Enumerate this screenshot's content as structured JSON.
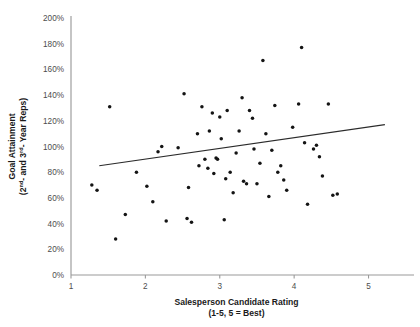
{
  "chart_data": {
    "type": "scatter",
    "title": "",
    "xlabel": "Salesperson Candidate Rating",
    "xlabel_sub": "(1-5, 5 = Best)",
    "ylabel_line1": "Goal Attainment",
    "ylabel_line2_pre": "(2",
    "ylabel_sup1": "nd",
    "ylabel_line2_mid": "- and 3",
    "ylabel_sup2": "rd",
    "ylabel_line2_post": "- Year Reps)",
    "ylabel": "Goal Attainment (2nd- and 3rd- Year Reps)",
    "xlim": [
      1,
      5.45
    ],
    "ylim": [
      0,
      200
    ],
    "xticks": [
      1,
      2,
      3,
      4,
      5
    ],
    "xtick_labels": [
      "1",
      "2",
      "3",
      "4",
      "5"
    ],
    "yticks": [
      0,
      20,
      40,
      60,
      80,
      100,
      120,
      140,
      160,
      180,
      200
    ],
    "ytick_labels": [
      "0%",
      "20%",
      "40%",
      "60%",
      "80%",
      "100%",
      "120%",
      "140%",
      "160%",
      "180%",
      "200%"
    ],
    "grid": false,
    "legend": false,
    "marker_color": "#141414",
    "axis_color": "#9a9a9a",
    "trendline_color": "#2b2b2b",
    "trendline": {
      "x0": 1.38,
      "y0": 85,
      "x1": 5.22,
      "y1": 117
    },
    "points": [
      [
        1.28,
        70
      ],
      [
        1.35,
        66
      ],
      [
        1.52,
        131
      ],
      [
        1.6,
        28
      ],
      [
        1.73,
        47
      ],
      [
        1.88,
        80
      ],
      [
        2.02,
        69
      ],
      [
        2.1,
        57
      ],
      [
        2.17,
        96
      ],
      [
        2.22,
        100
      ],
      [
        2.28,
        42
      ],
      [
        2.44,
        99
      ],
      [
        2.52,
        141
      ],
      [
        2.56,
        44
      ],
      [
        2.58,
        68
      ],
      [
        2.62,
        41
      ],
      [
        2.7,
        110
      ],
      [
        2.72,
        85
      ],
      [
        2.76,
        131
      ],
      [
        2.8,
        90
      ],
      [
        2.84,
        83
      ],
      [
        2.86,
        112
      ],
      [
        2.9,
        126
      ],
      [
        2.92,
        79
      ],
      [
        2.95,
        91
      ],
      [
        2.97,
        90
      ],
      [
        3.0,
        123
      ],
      [
        3.02,
        106
      ],
      [
        3.06,
        43
      ],
      [
        3.08,
        75
      ],
      [
        3.1,
        128
      ],
      [
        3.14,
        80
      ],
      [
        3.18,
        64
      ],
      [
        3.22,
        95
      ],
      [
        3.26,
        112
      ],
      [
        3.3,
        138
      ],
      [
        3.32,
        73
      ],
      [
        3.36,
        71
      ],
      [
        3.4,
        128
      ],
      [
        3.44,
        122
      ],
      [
        3.46,
        98
      ],
      [
        3.5,
        71
      ],
      [
        3.54,
        87
      ],
      [
        3.58,
        167
      ],
      [
        3.62,
        110
      ],
      [
        3.66,
        61
      ],
      [
        3.7,
        97
      ],
      [
        3.74,
        132
      ],
      [
        3.78,
        80
      ],
      [
        3.82,
        85
      ],
      [
        3.86,
        74
      ],
      [
        3.9,
        66
      ],
      [
        3.98,
        115
      ],
      [
        4.06,
        133
      ],
      [
        4.1,
        177
      ],
      [
        4.14,
        103
      ],
      [
        4.18,
        55
      ],
      [
        4.26,
        98
      ],
      [
        4.3,
        101
      ],
      [
        4.34,
        92
      ],
      [
        4.38,
        77
      ],
      [
        4.46,
        133
      ],
      [
        4.52,
        62
      ],
      [
        4.58,
        63
      ]
    ]
  }
}
